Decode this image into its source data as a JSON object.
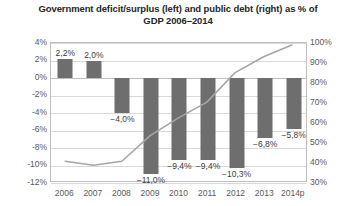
{
  "chart_title": "Government deficit/surplus (left) and public debt (right) as % of GDP 2006–2014",
  "axes": {
    "left_ticks": [
      "4%",
      "2%",
      "0%",
      "-2%",
      "-4%",
      "-6%",
      "-8%",
      "-10%",
      "-12%"
    ],
    "right_ticks": [
      "100%",
      "90%",
      "80%",
      "70%",
      "60%",
      "50%",
      "40%",
      "30%"
    ],
    "x_ticks": [
      "2006",
      "2007",
      "2008",
      "2009",
      "2010",
      "2011",
      "2012",
      "2013",
      "2014p"
    ]
  },
  "bar_labels": [
    "2,2%",
    "2,0%",
    "−4,0%",
    "−11,0%",
    "−9,4%",
    "−9,4%",
    "−10,3%",
    "−6,8%",
    "−5,8%"
  ],
  "colors": {
    "bar": "#6e6e6e",
    "line": "#a6a6a6",
    "grid": "#d9d9d9",
    "border": "#bfbfbf",
    "text": "#404040",
    "title": "#262626"
  },
  "chart_data": {
    "type": "bar",
    "title": "Government deficit/surplus (left) and public debt (right) as % of GDP 2006–2014",
    "subtitle": "",
    "xlabel": "",
    "ylabel": "",
    "categories": [
      "2006",
      "2007",
      "2008",
      "2009",
      "2010",
      "2011",
      "2012",
      "2013",
      "2014p"
    ],
    "grid": true,
    "legend": "none",
    "series": [
      {
        "name": "Government deficit/surplus (left)",
        "type": "bar",
        "axis": "left",
        "unit": "% of GDP",
        "values": [
          2.2,
          2.0,
          -4.0,
          -11.0,
          -9.4,
          -9.4,
          -10.3,
          -6.8,
          -5.8
        ],
        "labels": [
          "2,2%",
          "2,0%",
          "−4,0%",
          "−11,0%",
          "−9,4%",
          "−9,4%",
          "−10,3%",
          "−6,8%",
          "−5,8%"
        ],
        "color": "#6e6e6e"
      },
      {
        "name": "Public debt (right)",
        "type": "line",
        "axis": "right",
        "unit": "% of GDP",
        "values": [
          40,
          38,
          40,
          53,
          62,
          70,
          85,
          93,
          99
        ],
        "color": "#a6a6a6"
      }
    ],
    "ylim_left": [
      -12,
      4
    ],
    "ytick_left": [
      4,
      2,
      0,
      -2,
      -4,
      -6,
      -8,
      -10,
      -12
    ],
    "ylim_right": [
      30,
      100
    ],
    "ytick_right": [
      100,
      90,
      80,
      70,
      60,
      50,
      40,
      30
    ]
  }
}
